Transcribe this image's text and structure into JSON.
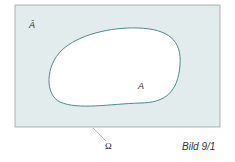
{
  "diagram": {
    "type": "venn-set-complement",
    "universe_label": "Ω",
    "set_label": "A",
    "complement_label": "Ā",
    "caption": "Bild 9/1",
    "colors": {
      "universe_fill": "#e3ecec",
      "universe_border": "#9aa3a3",
      "set_fill": "#ffffff",
      "set_border": "#4f8a91"
    }
  }
}
